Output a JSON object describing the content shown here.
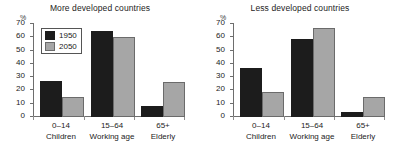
{
  "chart_data": {
    "type": "bar",
    "title": "",
    "categories": [
      "0–14",
      "15–64",
      "65+"
    ],
    "category_sublabels": [
      "Children",
      "Working age",
      "Elderly"
    ],
    "ylabel": "%",
    "xlabel": "",
    "ylim": [
      0,
      70
    ],
    "yticks": [
      0,
      10,
      20,
      30,
      40,
      50,
      60,
      70
    ],
    "grid": false,
    "legend_position": "top-left (first panel only)",
    "legend": [
      "1950",
      "2050"
    ],
    "colors": {
      "1950": "#1c1c1c",
      "2050": "#a6a6a6",
      "axis": "#6e6e6e",
      "text": "#232323"
    },
    "panels": [
      {
        "title": "More developed countries",
        "series": [
          {
            "name": "1950",
            "values": [
              27,
              65,
              8
            ]
          },
          {
            "name": "2050",
            "values": [
              15,
              60,
              26
            ]
          }
        ]
      },
      {
        "title": "Less developed countries",
        "series": [
          {
            "name": "1950",
            "values": [
              37,
              59,
              4
            ]
          },
          {
            "name": "2050",
            "values": [
              19,
              67,
              15
            ]
          }
        ]
      }
    ]
  }
}
